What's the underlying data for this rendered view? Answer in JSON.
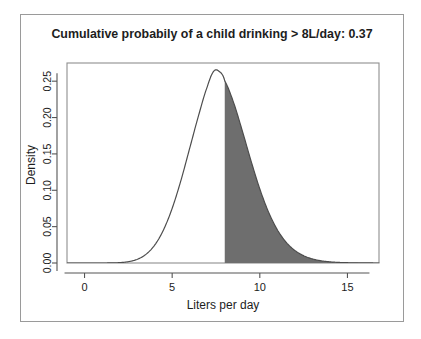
{
  "figure": {
    "title": "Cumulative probabily of a child drinking > 8L/day: 0.37",
    "xlabel": "Liters per day",
    "ylabel": "Density",
    "frame_color": "#9a9a9a",
    "axis_color": "#555555",
    "curve_color": "#4d4d4d",
    "fill_color": "#6e6e6e",
    "background": "#ffffff",
    "page_ghost_text": ""
  },
  "chart_data": {
    "type": "area",
    "title": "Cumulative probabily of a child drinking > 8L/day: 0.37",
    "xlabel": "Liters per day",
    "ylabel": "Density",
    "xlim": [
      -1.0,
      16.8
    ],
    "ylim": [
      0.0,
      0.275
    ],
    "xticks": [
      0,
      5,
      10,
      15
    ],
    "xtick_labels": [
      "0",
      "5",
      "10",
      "15"
    ],
    "yticks": [
      0.0,
      0.05,
      0.1,
      0.15,
      0.2,
      0.25
    ],
    "ytick_labels": [
      "0.00",
      "0.05",
      "0.10",
      "0.15",
      "0.20",
      "0.25"
    ],
    "grid": false,
    "legend": null,
    "shaded_region": {
      "from": 8,
      "to": 16.8,
      "label": "P(X > 8L/day) = 0.37",
      "probability": 0.37,
      "color": "#6e6e6e"
    },
    "series": [
      {
        "name": "Density of liters per day",
        "distribution": "skewed-unimodal (right-skewed, mode ~7.4)",
        "peak_x": 7.4,
        "peak_y": 0.265,
        "x": [
          0.0,
          0.5,
          1.0,
          1.5,
          2.0,
          2.5,
          3.0,
          3.5,
          4.0,
          4.5,
          5.0,
          5.5,
          6.0,
          6.5,
          7.0,
          7.4,
          7.8,
          8.0,
          8.5,
          9.0,
          9.5,
          10.0,
          10.5,
          11.0,
          11.5,
          12.0,
          12.5,
          13.0,
          13.5,
          14.0,
          14.5,
          15.0,
          15.5,
          16.0,
          16.8
        ],
        "y": [
          0.0,
          0.0,
          0.0,
          0.0001,
          0.0005,
          0.0018,
          0.005,
          0.0118,
          0.0245,
          0.0452,
          0.0751,
          0.1135,
          0.1578,
          0.2023,
          0.2421,
          0.2645,
          0.2612,
          0.2503,
          0.2209,
          0.1818,
          0.1403,
          0.1018,
          0.0699,
          0.0457,
          0.0286,
          0.0172,
          0.01,
          0.0056,
          0.003,
          0.0016,
          0.0008,
          0.0004,
          0.0002,
          0.0001,
          0.0
        ]
      }
    ]
  }
}
